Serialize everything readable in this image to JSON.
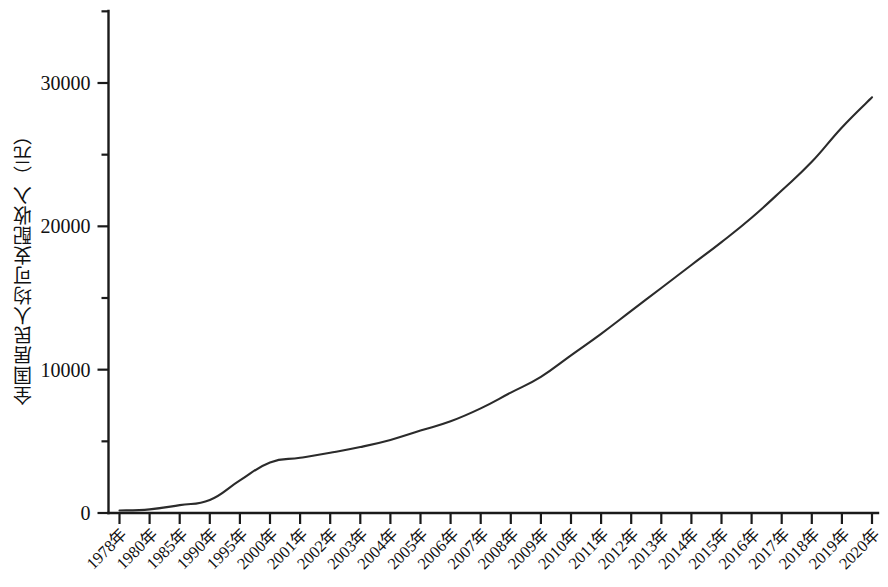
{
  "chart_data": {
    "type": "line",
    "title": "",
    "xlabel": "",
    "ylabel": "全国居民人均可支配收入（元）",
    "ylim": [
      0,
      35500
    ],
    "grid": false,
    "legend": null,
    "y_ticks_major": [
      "0",
      "10000",
      "20000",
      "30000"
    ],
    "y_ticks_major_values": [
      0,
      10000,
      20000,
      30000
    ],
    "y_ticks_minor_values": [
      5000,
      15000,
      25000,
      35000
    ],
    "categories": [
      "1978年",
      "1980年",
      "1985年",
      "1990年",
      "1995年",
      "2000年",
      "2001年",
      "2002年",
      "2003年",
      "2004年",
      "2005年",
      "2006年",
      "2007年",
      "2008年",
      "2009年",
      "2010年",
      "2011年",
      "2012年",
      "2013年",
      "2014年",
      "2015年",
      "2016年",
      "2017年",
      "2018年",
      "2019年",
      "2020年"
    ],
    "series": [
      {
        "name": "全国居民人均可支配收入",
        "values": [
          171,
          255,
          550,
          904,
          2270,
          3530,
          3850,
          4200,
          4600,
          5100,
          5750,
          6400,
          7300,
          8400,
          9500,
          11000,
          12500,
          14100,
          15700,
          17300,
          18900,
          20600,
          22500,
          24500,
          26900,
          29000
        ]
      }
    ]
  }
}
